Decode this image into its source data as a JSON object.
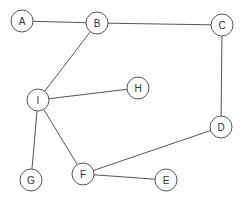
{
  "graph": {
    "nodes": [
      {
        "id": "A",
        "label": "A",
        "x": 22,
        "y": 21
      },
      {
        "id": "B",
        "label": "B",
        "x": 97,
        "y": 23
      },
      {
        "id": "C",
        "label": "C",
        "x": 222,
        "y": 25
      },
      {
        "id": "H",
        "label": "H",
        "x": 138,
        "y": 88
      },
      {
        "id": "I",
        "label": "I",
        "x": 38,
        "y": 100
      },
      {
        "id": "D",
        "label": "D",
        "x": 221,
        "y": 127
      },
      {
        "id": "G",
        "label": "G",
        "x": 31,
        "y": 180
      },
      {
        "id": "F",
        "label": "F",
        "x": 83,
        "y": 174
      },
      {
        "id": "E",
        "label": "E",
        "x": 166,
        "y": 180
      }
    ],
    "edges": [
      {
        "from": "A",
        "to": "B"
      },
      {
        "from": "B",
        "to": "C"
      },
      {
        "from": "B",
        "to": "I"
      },
      {
        "from": "C",
        "to": "D"
      },
      {
        "from": "I",
        "to": "H"
      },
      {
        "from": "I",
        "to": "G"
      },
      {
        "from": "I",
        "to": "F"
      },
      {
        "from": "D",
        "to": "F"
      },
      {
        "from": "F",
        "to": "E"
      }
    ],
    "node_radius": 11,
    "stroke_color": "#555555",
    "fill_color": "#ffffff"
  }
}
